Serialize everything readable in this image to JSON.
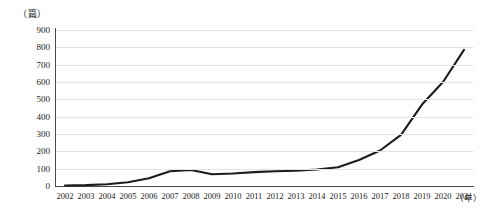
{
  "chart_data": {
    "type": "line",
    "title": "",
    "subtitle": "",
    "xlabel": "年",
    "ylabel": "篇",
    "unit_label": "（篇）",
    "xaxis_unit_label": "（年）",
    "grid": true,
    "legend": "none",
    "xlim": [
      2002,
      2021
    ],
    "ylim": [
      0,
      900
    ],
    "ytick_step": 100,
    "yticks": [
      0,
      100,
      200,
      300,
      400,
      500,
      600,
      700,
      800,
      900
    ],
    "categories": [
      "2002",
      "2003",
      "2004",
      "2005",
      "2006",
      "2007",
      "2008",
      "2009",
      "2010",
      "2011",
      "2012",
      "2013",
      "2014",
      "2015",
      "2016",
      "2017",
      "2018",
      "2019",
      "2020",
      "2021"
    ],
    "series": [
      {
        "name": "发文量",
        "values": [
          3,
          5,
          10,
          22,
          45,
          85,
          92,
          68,
          72,
          80,
          85,
          88,
          95,
          108,
          150,
          205,
          295,
          470,
          600,
          785
        ]
      }
    ]
  },
  "style": {
    "line_color": "#1c1c1c",
    "axis_color": "#4a4a4a",
    "grid_color": "#e3e3e3",
    "background": "#ffffff"
  }
}
